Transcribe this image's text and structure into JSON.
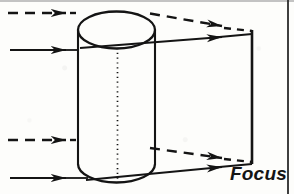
{
  "figure": {
    "kind": "optics-ray-diagram",
    "labels": {
      "focus": "Focus"
    },
    "colors": {
      "ink": "#141414",
      "paper": "#fdfdfb",
      "scan_edge": "#b9b9b9"
    },
    "cylinder": {
      "name": "cylindrical-lens",
      "left_x": 78,
      "right_x": 155,
      "top_ellipse_center_y": 30,
      "top_ellipse_ry": 18,
      "bottom_y": 182,
      "axis_x": 117,
      "axis_style": "dotted"
    },
    "focal_plane": {
      "name": "focal-plane-line",
      "x": 252,
      "top_y": 30,
      "bottom_y": 164
    },
    "rays": [
      {
        "id": "ray-upper-dashed",
        "style": "dashed",
        "incoming": {
          "x1": 8,
          "y1": 13,
          "x2": 78,
          "y2": 13
        },
        "incoming_arrow_at": {
          "x": 66,
          "y": 13
        },
        "outgoing": {
          "x1": 152,
          "y1": 14,
          "x2": 252,
          "y2": 31
        },
        "outgoing_arrow_at": {
          "x": 222,
          "y": 26
        }
      },
      {
        "id": "ray-upper-solid",
        "style": "solid",
        "incoming": {
          "x1": 10,
          "y1": 50,
          "x2": 78,
          "y2": 50
        },
        "incoming_arrow_at": {
          "x": 66,
          "y": 50
        },
        "outgoing": {
          "x1": 152,
          "y1": 44,
          "x2": 252,
          "y2": 34
        },
        "outgoing_arrow_at": {
          "x": 222,
          "y": 37
        }
      },
      {
        "id": "ray-lower-dashed",
        "style": "dashed",
        "incoming": {
          "x1": 8,
          "y1": 140,
          "x2": 78,
          "y2": 140
        },
        "incoming_arrow_at": {
          "x": 66,
          "y": 140
        },
        "outgoing": {
          "x1": 150,
          "y1": 148,
          "x2": 252,
          "y2": 162
        },
        "outgoing_arrow_at": {
          "x": 222,
          "y": 158
        }
      },
      {
        "id": "ray-lower-solid",
        "style": "solid",
        "incoming": {
          "x1": 10,
          "y1": 178,
          "x2": 78,
          "y2": 178
        },
        "incoming_arrow_at": {
          "x": 66,
          "y": 178
        },
        "outgoing": {
          "x1": 145,
          "y1": 178,
          "x2": 252,
          "y2": 164
        },
        "outgoing_arrow_at": {
          "x": 222,
          "y": 167
        }
      }
    ]
  }
}
